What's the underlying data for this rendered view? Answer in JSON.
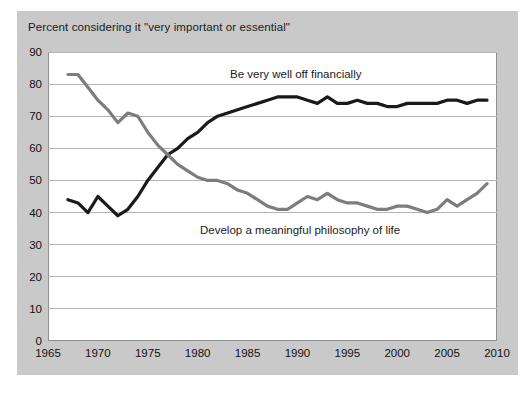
{
  "chart_data": {
    "type": "line",
    "title": "Percent considering it \"very important or essential\"",
    "xlabel": "",
    "ylabel": "",
    "xlim": [
      1965,
      2010
    ],
    "ylim": [
      0,
      90
    ],
    "ytick_values": [
      0,
      10,
      20,
      30,
      40,
      50,
      60,
      70,
      80,
      90
    ],
    "xtick_values": [
      1965,
      1970,
      1975,
      1980,
      1985,
      1990,
      1995,
      2000,
      2005,
      2010
    ],
    "ytick_labels": [
      "0",
      "10",
      "20",
      "30",
      "40",
      "50",
      "60",
      "70",
      "80",
      "90"
    ],
    "xtick_labels": [
      "1965",
      "1970",
      "1975",
      "1980",
      "1985",
      "1990",
      "1995",
      "2000",
      "2005",
      "2010"
    ],
    "grid": "horizontal",
    "legend": "inline-annotations",
    "series": [
      {
        "name": "Be very well off financially",
        "color": "#1a1a1a",
        "label_position": "upper-right",
        "x": [
          1967,
          1968,
          1969,
          1970,
          1971,
          1972,
          1973,
          1974,
          1975,
          1976,
          1977,
          1978,
          1979,
          1980,
          1981,
          1982,
          1983,
          1984,
          1985,
          1986,
          1987,
          1988,
          1989,
          1990,
          1991,
          1992,
          1993,
          1994,
          1995,
          1996,
          1997,
          1998,
          1999,
          2000,
          2001,
          2002,
          2003,
          2004,
          2005,
          2006,
          2007,
          2008,
          2009
        ],
        "values": [
          44,
          43,
          40,
          45,
          42,
          39,
          41,
          45,
          50,
          54,
          58,
          60,
          63,
          65,
          68,
          70,
          71,
          72,
          73,
          74,
          75,
          76,
          76,
          76,
          75,
          74,
          76,
          74,
          74,
          75,
          74,
          74,
          73,
          73,
          74,
          74,
          74,
          74,
          75,
          75,
          74,
          75,
          75
        ]
      },
      {
        "name": "Develop a meaningful philosophy of life",
        "color": "#7d7d7d",
        "label_position": "lower-center",
        "x": [
          1967,
          1968,
          1969,
          1970,
          1971,
          1972,
          1973,
          1974,
          1975,
          1976,
          1977,
          1978,
          1979,
          1980,
          1981,
          1982,
          1983,
          1984,
          1985,
          1986,
          1987,
          1988,
          1989,
          1990,
          1991,
          1992,
          1993,
          1994,
          1995,
          1996,
          1997,
          1998,
          1999,
          2000,
          2001,
          2002,
          2003,
          2004,
          2005,
          2006,
          2007,
          2008,
          2009
        ],
        "values": [
          83,
          83,
          79,
          75,
          72,
          68,
          71,
          70,
          65,
          61,
          58,
          55,
          53,
          51,
          50,
          50,
          49,
          47,
          46,
          44,
          42,
          41,
          41,
          43,
          45,
          44,
          46,
          44,
          43,
          43,
          42,
          41,
          41,
          42,
          42,
          41,
          40,
          41,
          44,
          42,
          44,
          46,
          49
        ]
      }
    ]
  }
}
